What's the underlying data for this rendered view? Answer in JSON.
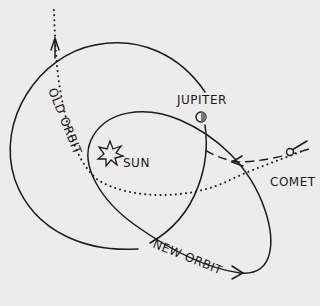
{
  "diagram": {
    "type": "orbital-diagram",
    "labels": {
      "jupiter": "JUPITER",
      "sun": "SUN",
      "comet": "COMET",
      "old_orbit": "OLD ORBIT",
      "new_orbit": "NEW ORBIT"
    },
    "colors": {
      "background": "#ececec",
      "ink": "#1c1c1c"
    }
  }
}
